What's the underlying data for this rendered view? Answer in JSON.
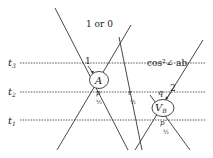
{
  "title_label": "1 or 0",
  "time_axis": {
    "t3": {
      "label": "t",
      "sub": "3"
    },
    "t2": {
      "label": "t",
      "sub": "2"
    },
    "t1": {
      "label": "t",
      "sub": "1"
    }
  },
  "nodes": {
    "A": {
      "label": "A"
    },
    "VB": {
      "label": "V",
      "sub": "B"
    }
  },
  "annotations": {
    "marker_1": "1",
    "marker_2": "2",
    "cos_label": "cos²∠ ab",
    "p": "p",
    "r": "r",
    "q": "q",
    "p_prime": "p′",
    "half_1": "½",
    "half_2": "½",
    "half_3": "½"
  },
  "colors": {
    "line": "#333333",
    "dashed": "#444444",
    "text": "#222222",
    "background": "#ffffff"
  }
}
